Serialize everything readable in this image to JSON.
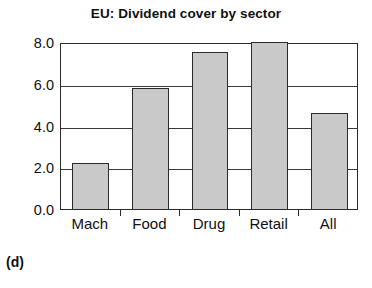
{
  "chart_data": {
    "type": "bar",
    "title": "EU: Dividend cover by sector",
    "xlabel": "",
    "ylabel": "",
    "categories": [
      "Mach",
      "Food",
      "Drug",
      "Retail",
      "All"
    ],
    "values": [
      2.2,
      5.8,
      7.5,
      8.0,
      4.6
    ],
    "ylim": [
      0.0,
      8.0
    ],
    "ytick_labels": [
      "0.0",
      "2.0",
      "4.0",
      "6.0",
      "8.0"
    ],
    "ytick_values": [
      0.0,
      2.0,
      4.0,
      6.0,
      8.0
    ],
    "grid": true,
    "legend": false,
    "bar_fill_color": "#c9c9c9",
    "bar_edge_color": "#2b2b2b",
    "axis_color": "#2b2b2b",
    "background_color": "#ffffff"
  },
  "figure": {
    "panel_caption": "(d)"
  }
}
